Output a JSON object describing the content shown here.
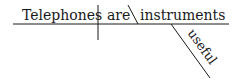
{
  "diagram": {
    "type": "sentence-diagram",
    "sentence": "Telephones are useful instruments",
    "subject": "Telephones",
    "verb": "are",
    "predicate_nominative": "instruments",
    "modifier": "useful",
    "line_color": "#1a1a1a"
  }
}
